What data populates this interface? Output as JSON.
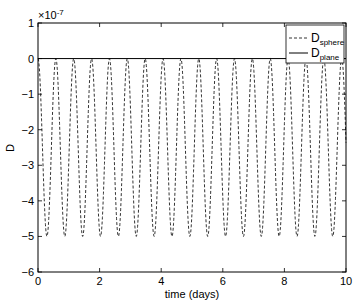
{
  "chart_data": {
    "type": "line",
    "title": "",
    "xlabel": "time (days)",
    "ylabel": "D",
    "y_exponent_label": "×10",
    "y_exponent_power": "-7",
    "xlim": [
      0,
      10
    ],
    "ylim": [
      -6,
      1
    ],
    "x_ticks": [
      "0",
      "2",
      "4",
      "6",
      "8",
      "10"
    ],
    "y_ticks": [
      "1",
      "0",
      "-1",
      "-2",
      "-3",
      "-4",
      "-5",
      "-6"
    ],
    "grid": false,
    "legend_position": "upper right",
    "series": [
      {
        "name": "D_sphere",
        "legend_main": "D",
        "legend_sub": "sphere",
        "style": "dashed",
        "color": "#000000",
        "description": "oscillation between 0 and -5e-7, period ~0.58 days (~17 cycles over 10 days)",
        "amplitude_min": -5,
        "amplitude_max": 0,
        "period_days": 0.58
      },
      {
        "name": "D_plane",
        "legend_main": "D",
        "legend_sub": "plane",
        "style": "solid",
        "color": "#000000",
        "description": "constant at 0",
        "value": 0
      }
    ]
  }
}
